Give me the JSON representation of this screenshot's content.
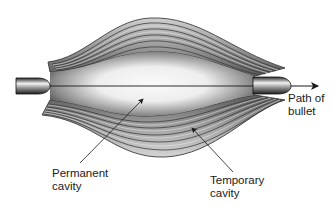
{
  "diagram": {
    "labels": {
      "path": {
        "line1": "Path of",
        "line2": "bullet"
      },
      "permanent": {
        "line1": "Permanent",
        "line2": "cavity"
      },
      "temporary": {
        "line1": "Temporary",
        "line2": "cavity"
      }
    },
    "icons": {
      "bullet_entry": "bullet-icon",
      "bullet_exit": "bullet-icon",
      "direction_arrow": "arrow-right-icon"
    },
    "colors": {
      "background": "#ffffff",
      "ink": "#1a1a1a",
      "tissue_dark": "#3a3a3a",
      "tissue_mid": "#8a8a8a",
      "tissue_light": "#e6e6e6",
      "cavity_center": "#f7f7f7"
    }
  }
}
